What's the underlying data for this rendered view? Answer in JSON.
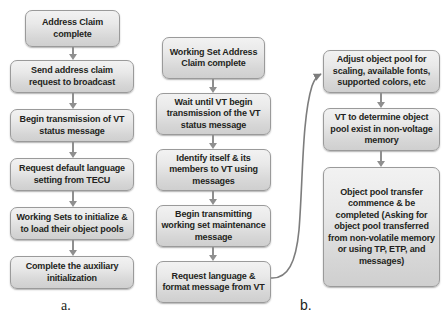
{
  "figure": {
    "panels": [
      {
        "letter": "a.",
        "nodes": [
          "Address Claim complete",
          "Send address claim request to broadcast",
          "Begin transmission of VT status message",
          "Request default language setting from TECU",
          "Working Sets to initialize & to load their object pools",
          "Complete the auxiliary initialization"
        ]
      },
      {
        "letter": "b.",
        "nodes_left": [
          "Working Set Address Claim complete",
          "Wait until VT begin transmission of the VT status message",
          "Identify itself & its members to VT using messages",
          "Begin transmitting working set maintenance message",
          "Request language & format message from VT"
        ],
        "nodes_right": [
          "Adjust object pool for scaling, available fonts, supported colors, etc",
          "VT to determine object pool exist in non-voltage memory",
          "Object pool transfer commence & be completed (Asking for object pool transferred from non-volatile memory or using TP, ETP, and messages)"
        ]
      }
    ]
  },
  "colors": {
    "box_border": "#9a9a9a",
    "box_fill_top": "#f2f2f2",
    "box_fill_bottom": "#cfcfcf",
    "text": "#231f20",
    "arrow": "#8f8f8f",
    "background": "#ffffff"
  }
}
